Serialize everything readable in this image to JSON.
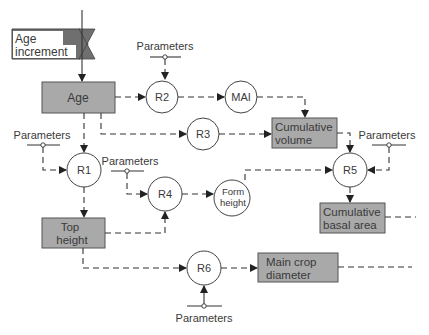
{
  "diagram": {
    "colors": {
      "box_fill": "#a9a9a9",
      "increment_fill": "#6f6f6f",
      "line": "#333333",
      "text": "#3a3a3a"
    },
    "input": {
      "line1": "Age",
      "line2": "increment"
    },
    "nodes": {
      "age": "Age",
      "r1": "R1",
      "r2": "R2",
      "r3": "R3",
      "r4": "R4",
      "r5": "R5",
      "r6": "R6",
      "mai": "MAI",
      "form_height_1": "Form",
      "form_height_2": "height",
      "cum_volume_1": "Cumulative",
      "cum_volume_2": "volume",
      "cum_basal_1": "Cumulative",
      "cum_basal_2": "basal area",
      "top_height_1": "Top",
      "top_height_2": "height",
      "main_crop_1": "Main crop",
      "main_crop_2": "diameter"
    },
    "parameters": {
      "r1": "Parameters",
      "r2": "Parameters",
      "r4": "Parameters",
      "r5": "Parameters",
      "r6": "Parameters"
    },
    "edges": [
      [
        "Age increment",
        "Age"
      ],
      [
        "Age",
        "R2"
      ],
      [
        "Age",
        "R3"
      ],
      [
        "Age",
        "R1"
      ],
      [
        "R2",
        "MAI"
      ],
      [
        "MAI",
        "Cumulative volume"
      ],
      [
        "R3",
        "Cumulative volume"
      ],
      [
        "Cumulative volume",
        "R5"
      ],
      [
        "Form height",
        "R5"
      ],
      [
        "R5",
        "Cumulative basal area"
      ],
      [
        "R1",
        "Top height"
      ],
      [
        "Top height",
        "R4"
      ],
      [
        "R4",
        "Form height"
      ],
      [
        "Top height",
        "R6"
      ],
      [
        "R6",
        "Main crop diameter"
      ]
    ]
  }
}
